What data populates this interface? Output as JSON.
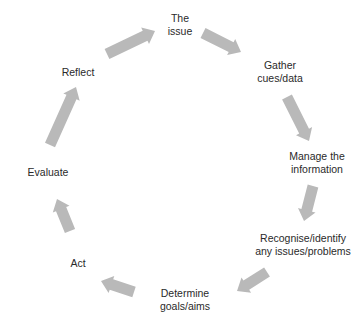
{
  "diagram": {
    "type": "cycle",
    "arrow_color": "#b9b9b9",
    "text_color": "#2a2a2a",
    "background": "#ffffff",
    "steps": [
      {
        "id": "the-issue",
        "lines": [
          "The",
          "issue"
        ],
        "x": 180,
        "y": 25
      },
      {
        "id": "gather-cues",
        "lines": [
          "Gather",
          "cues/data"
        ],
        "x": 280,
        "y": 72
      },
      {
        "id": "manage-information",
        "lines": [
          "Manage the",
          "information"
        ],
        "x": 317,
        "y": 163
      },
      {
        "id": "recognise-issues",
        "lines": [
          "Recognise/identify",
          "any issues/problems"
        ],
        "x": 303,
        "y": 245
      },
      {
        "id": "determine-goals",
        "lines": [
          "Determine",
          "goals/aims"
        ],
        "x": 185,
        "y": 300
      },
      {
        "id": "act",
        "lines": [
          "Act"
        ],
        "x": 78,
        "y": 263
      },
      {
        "id": "evaluate",
        "lines": [
          "Evaluate"
        ],
        "x": 48,
        "y": 172
      },
      {
        "id": "reflect",
        "lines": [
          "Reflect"
        ],
        "x": 78,
        "y": 72
      }
    ],
    "arrows": [
      {
        "from": "reflect",
        "to": "the-issue",
        "x1": 107,
        "y1": 54,
        "x2": 155,
        "y2": 31
      },
      {
        "from": "the-issue",
        "to": "gather-cues",
        "x1": 203,
        "y1": 33,
        "x2": 241,
        "y2": 52
      },
      {
        "from": "gather-cues",
        "to": "manage-information",
        "x1": 287,
        "y1": 97,
        "x2": 309,
        "y2": 141
      },
      {
        "from": "manage-information",
        "to": "recognise-issues",
        "x1": 313,
        "y1": 186,
        "x2": 304,
        "y2": 221
      },
      {
        "from": "recognise-issues",
        "to": "determine-goals",
        "x1": 267,
        "y1": 272,
        "x2": 237,
        "y2": 291
      },
      {
        "from": "determine-goals",
        "to": "act",
        "x1": 134,
        "y1": 292,
        "x2": 101,
        "y2": 281
      },
      {
        "from": "act",
        "to": "evaluate",
        "x1": 70,
        "y1": 231,
        "x2": 57,
        "y2": 199
      },
      {
        "from": "evaluate",
        "to": "reflect",
        "x1": 50,
        "y1": 145,
        "x2": 76,
        "y2": 87
      }
    ]
  }
}
